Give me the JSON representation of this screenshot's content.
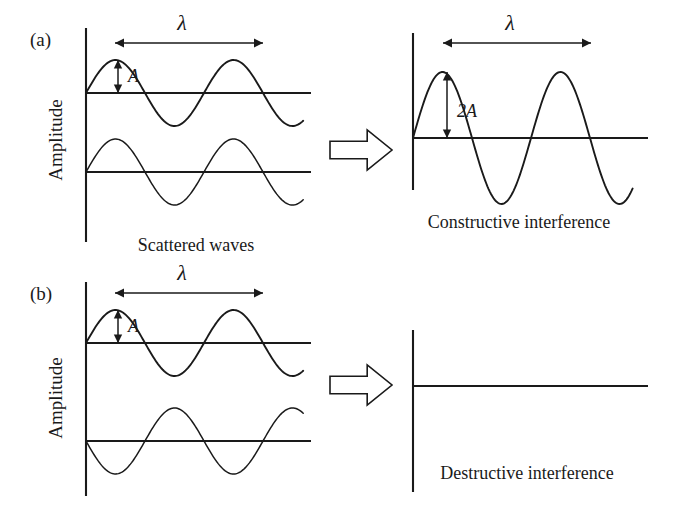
{
  "figure": {
    "background": "#ffffff",
    "ink": "#1a1a1a",
    "width": 700,
    "height": 524
  },
  "panels": [
    {
      "id": "a",
      "label": "(a)",
      "label_pos": {
        "x": 30,
        "y": 46
      },
      "axis_title": "Amplitude",
      "axis_title_pos": {
        "x": 62,
        "y": 140
      },
      "input": {
        "axis": {
          "x": 86,
          "y_top": 28,
          "y_bottom": 242
        },
        "baselines": [
          {
            "y": 93,
            "x_start": 86,
            "x_end": 311
          },
          {
            "y": 172,
            "x_start": 86,
            "x_end": 311
          }
        ],
        "waves": [
          {
            "name": "scattered-wave-top",
            "baseline_y": 93,
            "amplitude": 33,
            "wavelength": 118,
            "x_start": 86,
            "x_end": 304,
            "phase_deg": 0,
            "stroke_width": 1.9
          },
          {
            "name": "scattered-wave-bottom",
            "baseline_y": 172,
            "amplitude": 33,
            "wavelength": 118,
            "x_start": 86,
            "x_end": 304,
            "phase_deg": 0,
            "stroke_width": 1.5
          }
        ],
        "wavelength_dim": {
          "x_start": 115,
          "x_end": 263,
          "y": 43,
          "label": "λ",
          "label_x": 182,
          "label_y": 30
        },
        "amplitude_dim": {
          "x": 118,
          "y_top": 60,
          "y_bottom": 93,
          "label": "A",
          "label_x": 128,
          "label_y": 82
        },
        "caption": "Scattered waves",
        "caption_pos": {
          "x": 196,
          "y": 251
        }
      },
      "block_arrow": {
        "x": 330,
        "y": 130,
        "width": 62,
        "height": 40,
        "direction": "right"
      },
      "output": {
        "axis": {
          "x": 413,
          "y_top": 33,
          "y_bottom": 190
        },
        "baseline": {
          "y": 138,
          "x_start": 413,
          "x_end": 648
        },
        "wave": {
          "name": "constructive-wave",
          "baseline_y": 138,
          "amplitude": 66,
          "wavelength": 118,
          "x_start": 413,
          "x_end": 633,
          "phase_deg": 0,
          "stroke_width": 1.9
        },
        "wavelength_dim": {
          "x_start": 443,
          "x_end": 591,
          "y": 43,
          "label": "λ",
          "label_x": 510,
          "label_y": 30
        },
        "amplitude_dim": {
          "x": 447,
          "y_top": 72,
          "y_bottom": 138,
          "label": "2A",
          "label_x": 457,
          "label_y": 117
        },
        "caption": "Constructive interference",
        "caption_pos": {
          "x": 519,
          "y": 228
        }
      }
    },
    {
      "id": "b",
      "label": "(b)",
      "label_pos": {
        "x": 30,
        "y": 300
      },
      "axis_title": "Amplitude",
      "axis_title_pos": {
        "x": 62,
        "y": 398
      },
      "input": {
        "axis": {
          "x": 86,
          "y_top": 282,
          "y_bottom": 496
        },
        "baselines": [
          {
            "y": 343,
            "x_start": 86,
            "x_end": 311
          },
          {
            "y": 441,
            "x_start": 86,
            "x_end": 311
          }
        ],
        "waves": [
          {
            "name": "scattered-wave-top",
            "baseline_y": 343,
            "amplitude": 33,
            "wavelength": 118,
            "x_start": 86,
            "x_end": 304,
            "phase_deg": 0,
            "stroke_width": 1.9
          },
          {
            "name": "scattered-wave-bottom-inverted",
            "baseline_y": 441,
            "amplitude": 33,
            "wavelength": 118,
            "x_start": 86,
            "x_end": 304,
            "phase_deg": 180,
            "stroke_width": 1.5
          }
        ],
        "wavelength_dim": {
          "x_start": 115,
          "x_end": 263,
          "y": 293,
          "label": "λ",
          "label_x": 182,
          "label_y": 280
        },
        "amplitude_dim": {
          "x": 118,
          "y_top": 310,
          "y_bottom": 343,
          "label": "A",
          "label_x": 128,
          "label_y": 332
        },
        "caption": "",
        "caption_pos": {
          "x": 196,
          "y": 511
        }
      },
      "block_arrow": {
        "x": 330,
        "y": 365,
        "width": 62,
        "height": 40,
        "direction": "right"
      },
      "output": {
        "axis": {
          "x": 413,
          "y_top": 330,
          "y_bottom": 492
        },
        "baseline": {
          "y": 386,
          "x_start": 413,
          "x_end": 648
        },
        "wave": {
          "name": "destructive-flat-line",
          "baseline_y": 386,
          "amplitude": 0,
          "wavelength": 118,
          "x_start": 413,
          "x_end": 648,
          "phase_deg": 0,
          "stroke_width": 1.9
        },
        "wavelength_dim": null,
        "amplitude_dim": null,
        "caption": "Destructive interference",
        "caption_pos": {
          "x": 527,
          "y": 479
        }
      }
    }
  ],
  "chart_data": {
    "type": "line",
    "xlabel": "",
    "ylabel": "Amplitude",
    "grid": false,
    "legend": "none",
    "annotations": [
      "λ",
      "A",
      "2A",
      "(a)",
      "(b)"
    ],
    "captions": [
      "Scattered waves",
      "Constructive interference",
      "Destructive interference"
    ],
    "panels": [
      {
        "id": "a",
        "label": "(a)",
        "mechanism": "Constructive interference",
        "inputs": [
          {
            "name": "wave 1",
            "form": "sine",
            "amplitude": 1.0,
            "amplitude_label": "A",
            "wavelength": 1.0,
            "wavelength_label": "λ",
            "phase_deg": 0
          },
          {
            "name": "wave 2",
            "form": "sine",
            "amplitude": 1.0,
            "amplitude_label": "A",
            "wavelength": 1.0,
            "wavelength_label": "λ",
            "phase_deg": 0
          }
        ],
        "output": {
          "name": "sum",
          "form": "sine",
          "amplitude": 2.0,
          "amplitude_label": "2A",
          "wavelength": 1.0,
          "wavelength_label": "λ",
          "phase_deg": 0
        }
      },
      {
        "id": "b",
        "label": "(b)",
        "mechanism": "Destructive interference",
        "inputs": [
          {
            "name": "wave 1",
            "form": "sine",
            "amplitude": 1.0,
            "amplitude_label": "A",
            "wavelength": 1.0,
            "wavelength_label": "λ",
            "phase_deg": 0
          },
          {
            "name": "wave 2",
            "form": "sine",
            "amplitude": 1.0,
            "amplitude_label": "A",
            "wavelength": 1.0,
            "wavelength_label": "λ",
            "phase_deg": 180
          }
        ],
        "output": {
          "name": "sum",
          "form": "flat line",
          "amplitude": 0.0,
          "amplitude_label": "0",
          "wavelength": 1.0,
          "wavelength_label": "λ",
          "phase_deg": 0
        }
      }
    ]
  }
}
